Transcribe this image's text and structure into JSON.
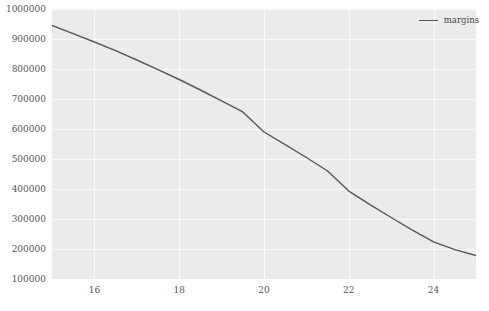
{
  "chart_data": {
    "type": "line",
    "title": "",
    "xlabel": "",
    "ylabel": "",
    "xlim": [
      15,
      25
    ],
    "ylim": [
      100000,
      1000000
    ],
    "grid": true,
    "legend_position": "upper right",
    "xticks": [
      16,
      18,
      20,
      22,
      24
    ],
    "xtick_labels": [
      "16",
      "18",
      "20",
      "22",
      "24"
    ],
    "yticks": [
      100000,
      200000,
      300000,
      400000,
      500000,
      600000,
      700000,
      800000,
      900000,
      1000000
    ],
    "ytick_labels": [
      "100000",
      "200000",
      "300000",
      "400000",
      "500000",
      "600000",
      "700000",
      "800000",
      "900000",
      "1000000"
    ],
    "series": [
      {
        "name": "margins",
        "color": "#575757",
        "x": [
          15,
          15.5,
          16,
          16.5,
          17,
          17.5,
          18,
          18.5,
          19,
          19.5,
          20,
          20.5,
          21,
          21.5,
          22,
          22.5,
          23,
          23.5,
          24,
          24.5,
          25
        ],
        "values": [
          945000,
          918000,
          890000,
          861000,
          830000,
          798000,
          765000,
          730000,
          694000,
          657000,
          590000,
          548000,
          505000,
          460000,
          393000,
          348000,
          305000,
          263000,
          224000,
          198000,
          178000
        ]
      }
    ]
  },
  "legend": {
    "entries": [
      {
        "label": "margins",
        "color": "#575757"
      }
    ]
  },
  "panel": {
    "background_color": "#ebebeb",
    "gridline_color": "#fafafa"
  }
}
